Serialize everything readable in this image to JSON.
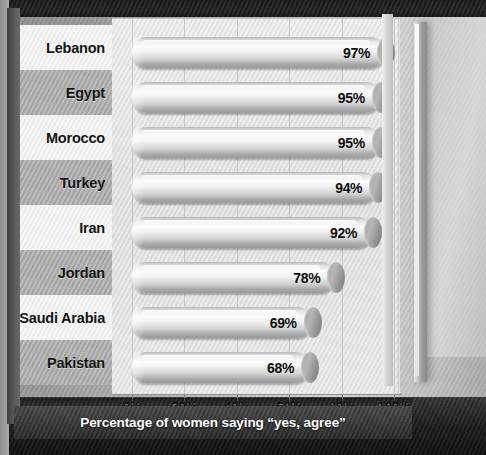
{
  "chart_data": {
    "type": "bar",
    "orientation": "horizontal",
    "title": "",
    "subtitle": "",
    "categories": [
      "Lebanon",
      "Egypt",
      "Morocco",
      "Turkey",
      "Iran",
      "Jordan",
      "Saudi Arabia",
      "Pakistan"
    ],
    "values": [
      97,
      95,
      95,
      94,
      92,
      78,
      69,
      68
    ],
    "value_labels": [
      "97%",
      "95%",
      "95%",
      "94%",
      "92%",
      "78%",
      "69%",
      "68%"
    ],
    "xlabel": "Percentage of women saying “yes, agree”",
    "ylabel": "",
    "xlim": [
      0,
      100
    ],
    "xticks": [
      0,
      20,
      40,
      60,
      80,
      100
    ],
    "xtick_labels": [
      "0%",
      "20%",
      "40%",
      "60%",
      "80%",
      "100%"
    ],
    "grid": true,
    "legend": false,
    "legend_position": "none",
    "series": [
      {
        "name": "Percentage of women saying “yes, agree”",
        "values": [
          97,
          95,
          95,
          94,
          92,
          78,
          69,
          68
        ]
      }
    ],
    "style": {
      "bar_style": "3d-cylinder",
      "palette": "grayscale",
      "bar_fill_light": "#fbfbfb",
      "bar_fill_dark": "#9a9a9a",
      "plot_background": "#e4e4e4",
      "band_light": "#f1f1f1",
      "band_dark": "#aeaeae",
      "caption_band": "#3a3a3a",
      "caption_text": "#ffffff"
    }
  },
  "axis": {
    "label": "Percentage of women saying “yes, agree”",
    "ticks": [
      {
        "value": 0,
        "label": "0%"
      },
      {
        "value": 20,
        "label": "20%"
      },
      {
        "value": 40,
        "label": "40%"
      },
      {
        "value": 60,
        "label": "60%"
      },
      {
        "value": 80,
        "label": "80%"
      },
      {
        "value": 100,
        "label": "100%"
      }
    ]
  },
  "rows": [
    {
      "category": "Lebanon",
      "value": 97,
      "label": "97%"
    },
    {
      "category": "Egypt",
      "value": 95,
      "label": "95%"
    },
    {
      "category": "Morocco",
      "value": 95,
      "label": "95%"
    },
    {
      "category": "Turkey",
      "value": 94,
      "label": "94%"
    },
    {
      "category": "Iran",
      "value": 92,
      "label": "92%"
    },
    {
      "category": "Jordan",
      "value": 78,
      "label": "78%"
    },
    {
      "category": "Saudi Arabia",
      "value": 69,
      "label": "69%"
    },
    {
      "category": "Pakistan",
      "value": 68,
      "label": "68%"
    }
  ]
}
